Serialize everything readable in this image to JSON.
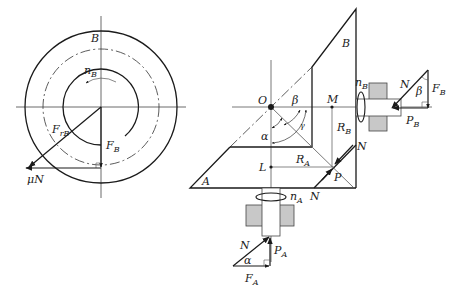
{
  "figure": {
    "left_view": {
      "gear_label": "B",
      "rotation_label": "n",
      "rotation_sub": "B",
      "radial_force_label": "F",
      "radial_force_sub": "rB",
      "tangential_force_label": "F",
      "tangential_force_sub": "B",
      "friction_label": "μN"
    },
    "right_view": {
      "gear_b_label": "B",
      "gear_a_label": "A",
      "origin_label": "O",
      "point_m_label": "M",
      "point_l_label": "L",
      "point_p_label": "P",
      "angle_beta": "β",
      "angle_alpha": "α",
      "angle_gamma": "γ",
      "radius_b_label": "R",
      "radius_b_sub": "B",
      "radius_a_label": "R",
      "radius_a_sub": "A",
      "normal_label_1": "N",
      "normal_label_2": "N",
      "rotation_a_label": "n",
      "rotation_a_sub": "A",
      "rotation_b_label": "n",
      "rotation_b_sub": "B"
    },
    "force_triangle_b": {
      "normal": "N",
      "angle": "β",
      "force": "F",
      "force_sub": "B",
      "axial": "P",
      "axial_sub": "B"
    },
    "force_triangle_a": {
      "normal": "N",
      "angle": "α",
      "force": "F",
      "force_sub": "A",
      "axial": "P",
      "axial_sub": "A"
    },
    "colors": {
      "line": "#1a1a1a",
      "thin_line": "#555555",
      "bearing_fill": "#c8c8c8"
    }
  }
}
